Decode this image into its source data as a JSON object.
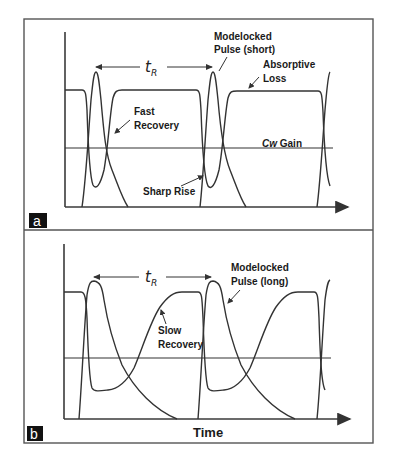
{
  "figure": {
    "colors": {
      "line": "#333333",
      "background": "#ffffff",
      "panel_tag": "#111111"
    },
    "x_axis_label": "Time",
    "panels": [
      {
        "tag": "a",
        "period_label": "t",
        "period_sub": "R",
        "labels": {
          "pulse": [
            "Modelocked",
            "Pulse (short)"
          ],
          "loss": [
            "Absorptive",
            "Loss"
          ],
          "recovery": [
            "Fast",
            "Recovery"
          ],
          "gain": "Cw Gain",
          "gain_italic": "Cw",
          "gain_rest": " Gain",
          "rise": "Sharp Rise"
        }
      },
      {
        "tag": "b",
        "period_label": "t",
        "period_sub": "R",
        "labels": {
          "pulse": [
            "Modelocked",
            "Pulse (long)"
          ],
          "recovery": [
            "Slow",
            "Recovery"
          ]
        }
      }
    ]
  }
}
